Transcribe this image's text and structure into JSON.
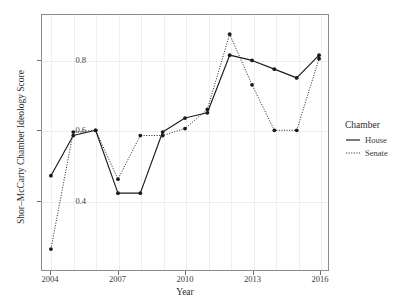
{
  "chart_data": {
    "type": "line",
    "title": "",
    "xlabel": "Year",
    "ylabel": "Shor–McCarty Chamber Ideology Score",
    "x": [
      2004,
      2005,
      2006,
      2007,
      2008,
      2009,
      2010,
      2011,
      2012,
      2013,
      2014,
      2015,
      2016
    ],
    "xlim": [
      2003.6,
      2016.4
    ],
    "ylim": [
      0.2,
      0.93
    ],
    "xticks": [
      2004,
      2007,
      2010,
      2013,
      2016
    ],
    "xtick_labels": [
      "2004",
      "2007",
      "2010",
      "2013",
      "2016"
    ],
    "yticks": [
      0.4,
      0.6,
      0.8
    ],
    "ytick_labels": [
      "0.4",
      "0.6",
      "0.8"
    ],
    "grid": true,
    "legend_position": "right",
    "legend_title": "Chamber",
    "series": [
      {
        "name": "House",
        "linestyle": "solid",
        "color": "#1a1a1a",
        "marker": "circle",
        "values": [
          0.47,
          0.585,
          0.6,
          0.42,
          0.42,
          0.595,
          0.635,
          0.65,
          0.815,
          0.8,
          0.775,
          0.75,
          0.815
        ]
      },
      {
        "name": "Senate",
        "linestyle": "dotted",
        "color": "#1a1a1a",
        "marker": "circle",
        "values": [
          0.26,
          0.595,
          0.6,
          0.46,
          0.585,
          0.585,
          0.605,
          0.66,
          0.875,
          0.73,
          0.6,
          0.6,
          0.805
        ]
      }
    ]
  },
  "legend": {
    "title": "Chamber",
    "items": [
      {
        "label": "House",
        "style": "solid"
      },
      {
        "label": "Senate",
        "style": "dotted"
      }
    ]
  }
}
